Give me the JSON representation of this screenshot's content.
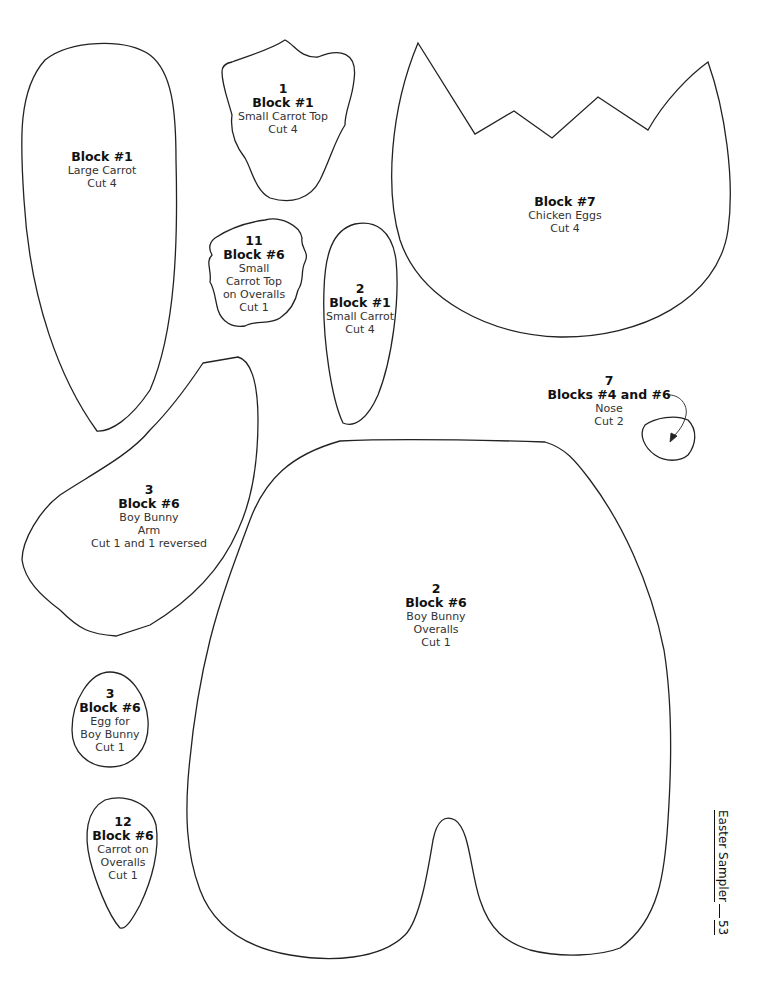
{
  "page": {
    "footer": {
      "title": "Easter Sampler",
      "page_number": "53"
    }
  },
  "pieces": [
    {
      "id": "large-carrot",
      "number": "",
      "block": "Block #1",
      "lines": [
        "Large Carrot",
        "Cut 4"
      ]
    },
    {
      "id": "small-carrot-top",
      "number": "1",
      "block": "Block #1",
      "lines": [
        "Small Carrot Top",
        "Cut 4"
      ]
    },
    {
      "id": "chicken-eggs",
      "number": "",
      "block": "Block #7",
      "lines": [
        "Chicken Eggs",
        "Cut 4"
      ]
    },
    {
      "id": "small-carrot-top-overalls",
      "number": "11",
      "block": "Block #6",
      "lines": [
        "Small",
        "Carrot Top",
        "on Overalls",
        "Cut 1"
      ]
    },
    {
      "id": "small-carrot",
      "number": "2",
      "block": "Block #1",
      "lines": [
        "Small Carrot",
        "Cut 4"
      ]
    },
    {
      "id": "nose",
      "number": "7",
      "block": "Blocks #4 and #6",
      "lines": [
        "Nose",
        "Cut 2"
      ]
    },
    {
      "id": "boy-bunny-arm",
      "number": "3",
      "block": "Block #6",
      "lines": [
        "Boy Bunny",
        "Arm",
        "Cut 1 and 1 reversed"
      ]
    },
    {
      "id": "boy-bunny-overalls",
      "number": "2",
      "block": "Block #6",
      "lines": [
        "Boy Bunny",
        "Overalls",
        "Cut 1"
      ]
    },
    {
      "id": "egg-boy-bunny",
      "number": "3",
      "block": "Block #6",
      "lines": [
        "Egg for",
        "Boy Bunny",
        "Cut 1"
      ]
    },
    {
      "id": "carrot-on-overalls",
      "number": "12",
      "block": "Block #6",
      "lines": [
        "Carrot on",
        "Overalls",
        "Cut 1"
      ]
    }
  ]
}
